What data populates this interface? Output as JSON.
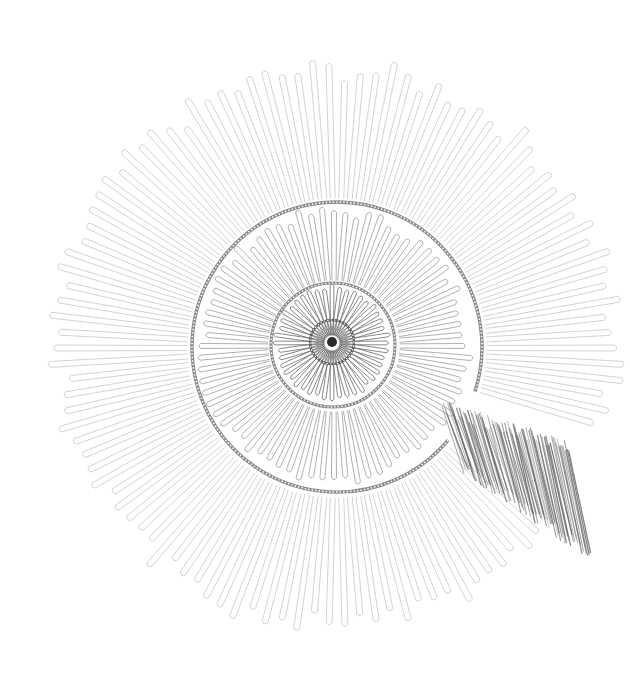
{
  "image": {
    "width": 630,
    "height": 674,
    "background": "#ffffff",
    "subject": "Pencil drawing of a spiral shell form with radiating looped petals",
    "alt_text": "Graphite sketch of a spiral composed of concentric whorls of elongated loops radiating from a dark central point, with a patch of dense hatching on the lower right"
  },
  "palette": {
    "petal_outer": "#b4b4b4",
    "petal_mid": "#8e8e8e",
    "petal_inner": "#6a6a6a",
    "ring": "#8a8a8a",
    "ring_dark": "#5a5a5a",
    "core": "#2a2a2a",
    "hatching": "#6f6f6f"
  },
  "geometry": {
    "core": {
      "cx": 332,
      "cy": 342,
      "dot_r": 5,
      "ring_r": 22
    },
    "whorls": [
      {
        "name": "inner",
        "cx": 332,
        "cy": 343,
        "r_in": 8,
        "r_out": 60,
        "count": 44,
        "loop_width": 3.2,
        "color_key": "petal_inner",
        "stroke": 0.8
      },
      {
        "name": "middle",
        "cx": 334,
        "cy": 346,
        "r_in": 66,
        "r_out": 140,
        "count": 72,
        "loop_width": 4.2,
        "color_key": "petal_mid",
        "stroke": 0.7
      },
      {
        "name": "outer",
        "cx": 337,
        "cy": 348,
        "r_in": 150,
        "r_out": 288,
        "count": 110,
        "loop_width": 5.0,
        "color_key": "petal_outer",
        "stroke": 0.6,
        "gap_start_deg": 18,
        "gap_end_deg": 42
      }
    ],
    "rings": [
      {
        "name": "core-ring",
        "cx": 332,
        "cy": 342,
        "r": 22,
        "width": 2.4,
        "color_key": "ring_dark"
      },
      {
        "name": "second-ring",
        "cx": 333,
        "cy": 345,
        "r": 62,
        "width": 3.0,
        "color_key": "ring"
      },
      {
        "name": "third-ring",
        "cx": 337,
        "cy": 347,
        "r": 145,
        "width": 3.4,
        "color_key": "ring",
        "arc_start_deg": 40,
        "arc_end_deg": 378
      }
    ],
    "hatching": {
      "x0": 452,
      "y0": 400,
      "x1": 580,
      "y1": 548,
      "count": 90,
      "color_key": "hatching"
    }
  }
}
